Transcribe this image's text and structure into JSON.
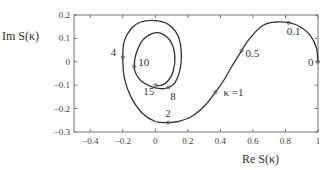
{
  "chart_data": {
    "type": "line",
    "title": "",
    "xlabel": "Re S(κ)",
    "ylabel": "Im S(κ)",
    "xlim": [
      -0.5,
      1.0
    ],
    "ylim": [
      -0.3,
      0.2
    ],
    "grid": false,
    "legend": null,
    "x_ticks": [
      -0.4,
      -0.2,
      0,
      0.2,
      0.4,
      0.6,
      0.8,
      1
    ],
    "x_tick_labels": [
      "−0.4",
      "−0.2",
      "0",
      "0.2",
      "0.4",
      "0.6",
      "0.8",
      "1"
    ],
    "y_ticks": [
      0.2,
      0.1,
      0,
      -0.1,
      -0.2,
      -0.3
    ],
    "y_tick_labels": [
      "0.2",
      "0.1",
      "0",
      "−0.1",
      "−0.2",
      "−0.3"
    ],
    "series": [
      {
        "name": "S(κ) spiral",
        "x": [
          1.0,
          0.99,
          0.95,
          0.89,
          0.82,
          0.74,
          0.66,
          0.58,
          0.53,
          0.47,
          0.42,
          0.37,
          0.3,
          0.22,
          0.14,
          0.08,
          0.0,
          -0.08,
          -0.15,
          -0.19,
          -0.2,
          -0.19,
          -0.15,
          -0.09,
          0.0,
          0.08,
          0.14,
          0.16,
          0.15,
          0.12,
          0.08,
          0.03,
          -0.03,
          -0.09,
          -0.12,
          -0.13,
          -0.12,
          -0.08,
          -0.02,
          0.04,
          0.1,
          0.12,
          0.11,
          0.08,
          0.04,
          0.0
        ],
        "y": [
          0.0,
          0.06,
          0.115,
          0.15,
          0.167,
          0.17,
          0.155,
          0.1,
          0.047,
          -0.02,
          -0.08,
          -0.13,
          -0.19,
          -0.235,
          -0.255,
          -0.26,
          -0.255,
          -0.22,
          -0.15,
          -0.07,
          0.02,
          0.09,
          0.14,
          0.17,
          0.176,
          0.16,
          0.11,
          0.03,
          -0.04,
          -0.09,
          -0.11,
          -0.115,
          -0.105,
          -0.08,
          -0.05,
          -0.02,
          0.03,
          0.09,
          0.12,
          0.12,
          0.08,
          0.02,
          -0.04,
          -0.08,
          -0.1,
          -0.1
        ]
      }
    ],
    "annotations": [
      {
        "text": "0",
        "x": 1.0,
        "y": 0.0
      },
      {
        "text": "0.1",
        "x": 0.82,
        "y": 0.167
      },
      {
        "text": "0.5",
        "x": 0.53,
        "y": 0.047
      },
      {
        "text": "κ =1",
        "x": 0.37,
        "y": -0.13
      },
      {
        "text": "2",
        "x": 0.08,
        "y": -0.26
      },
      {
        "text": "4",
        "x": -0.2,
        "y": 0.02
      },
      {
        "text": "8",
        "x": 0.08,
        "y": -0.11
      },
      {
        "text": "10",
        "x": -0.13,
        "y": -0.02
      },
      {
        "text": "15",
        "x": 0.0,
        "y": -0.1
      }
    ]
  },
  "colors": {
    "curve": "#333333",
    "axes": "#777777",
    "text": "#333333",
    "background": "#ffffff"
  }
}
